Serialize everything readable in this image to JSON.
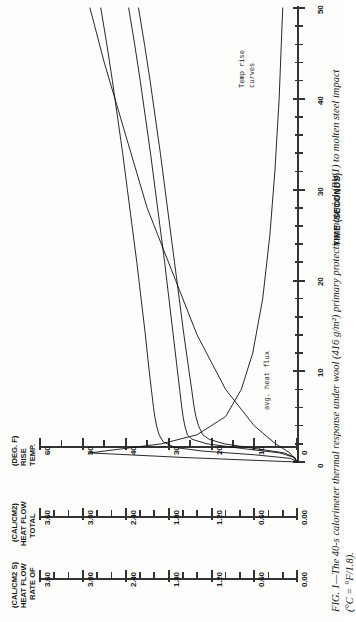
{
  "figure": {
    "caption_line1": "FIG. 1—The 40-s calorimeter thermal response under wool (416 g/m²) primary protection material (PW1) to molten steel impact",
    "caption_line2": "(°C = °F/1.8).",
    "caption_label": "FIG. 1—"
  },
  "annotations": {
    "temp_rise_line1": "Temp rise",
    "temp_rise_line2": "curves",
    "heat_flux": "avg. heat flux"
  },
  "axes": {
    "time": {
      "title": "TIME (SECONDS)",
      "min": 0,
      "max": 50,
      "major_step": 10,
      "minor_step": 2,
      "labels": [
        "0",
        "10",
        "20",
        "30",
        "40",
        "50"
      ],
      "label_values": [
        0,
        10,
        20,
        30,
        40,
        50
      ]
    },
    "temp_rise": {
      "title_lines": [
        "TEMP.",
        "RISE",
        "(DEG. F)"
      ],
      "min": 0,
      "max": 60,
      "major_step": 10,
      "minor_step": 5,
      "labels": [
        "60",
        "50",
        "40",
        "30",
        "20",
        "10",
        "0"
      ],
      "label_values": [
        60,
        50,
        40,
        30,
        20,
        10,
        0
      ]
    },
    "total_heat_flow": {
      "title_lines": [
        "TOTAL",
        "HEAT FLOW",
        "(CAL/CM2)"
      ],
      "title_superscript": "2",
      "min": 0.0,
      "max": 3.6,
      "major_step": 0.6,
      "minor_step": 0.2,
      "labels": [
        "3.60",
        "3.00",
        "2.40",
        "1.80",
        "1.20",
        "0.60",
        "0.00"
      ],
      "label_values": [
        3.6,
        3.0,
        2.4,
        1.8,
        1.2,
        0.6,
        0.0
      ]
    },
    "rate_of_heat_flow": {
      "title_lines": [
        "RATE OF",
        "HEAT FLOW",
        "(CAL/CM2 S)"
      ],
      "title_superscript": "2",
      "min": 0.0,
      "max": 3.6,
      "major_step": 0.6,
      "minor_step": 0.2,
      "labels": [
        "3.60",
        "3.00",
        "2.40",
        "1.80",
        "1.20",
        "0.60",
        "0.00"
      ],
      "label_values": [
        3.6,
        3.0,
        2.4,
        1.8,
        1.2,
        0.6,
        0.0
      ]
    }
  },
  "chart_data": {
    "type": "line",
    "orientation": "rotated-90-ccw",
    "xlabel": "TIME (SECONDS)",
    "ylabel": "TEMP. RISE (DEG. F)",
    "xlim": [
      0,
      50
    ],
    "ylim": [
      0,
      60
    ],
    "grid": false,
    "legend": "in-plot annotations",
    "series": [
      {
        "name": "Temp rise curve 1",
        "annotation": "Temp rise curves",
        "x": [
          0,
          0.5,
          1,
          1.5,
          2,
          2.5,
          3,
          4,
          5,
          6,
          8,
          10,
          14,
          18,
          22,
          26,
          30,
          34,
          38,
          42,
          46,
          50
        ],
        "y": [
          0,
          0.5,
          3,
          10,
          17,
          20.5,
          22,
          23,
          23.6,
          24,
          24.6,
          25.2,
          26.4,
          27.5,
          28.6,
          29.7,
          30.8,
          31.9,
          33.1,
          34.3,
          35.6,
          37.0
        ]
      },
      {
        "name": "Temp rise curve 2",
        "x": [
          0,
          0.5,
          1,
          1.5,
          2,
          2.5,
          3,
          4,
          5,
          6,
          8,
          10,
          14,
          18,
          22,
          26,
          30,
          34,
          38,
          42,
          46,
          50
        ],
        "y": [
          0,
          0.6,
          4,
          13,
          21,
          24.5,
          25.6,
          26.2,
          26.6,
          26.9,
          27.4,
          27.9,
          28.9,
          29.9,
          30.9,
          32.0,
          33.1,
          34.2,
          35.4,
          36.6,
          37.9,
          39.3
        ]
      },
      {
        "name": "Temp rise curve 3",
        "x": [
          0,
          0.4,
          0.8,
          1.2,
          1.6,
          2.2,
          3,
          4,
          5,
          6,
          8,
          10,
          14,
          18,
          22,
          26,
          30,
          34,
          38,
          42,
          46,
          50
        ],
        "y": [
          0,
          1.5,
          10,
          22,
          28.5,
          31.2,
          32.2,
          32.8,
          33.2,
          33.5,
          34.0,
          34.5,
          35.4,
          36.4,
          37.4,
          38.5,
          39.6,
          40.7,
          41.9,
          43.1,
          44.4,
          45.8
        ]
      },
      {
        "name": "avg. heat flux",
        "annotation": "avg. heat flux",
        "axis": "rate_of_heat_flow",
        "x": [
          0,
          0.5,
          1,
          1.5,
          2,
          3,
          5,
          8,
          12,
          18,
          25,
          32,
          40,
          46,
          50
        ],
        "y": [
          0,
          1.6,
          2.9,
          2.4,
          1.9,
          1.4,
          1.0,
          0.78,
          0.62,
          0.48,
          0.38,
          0.31,
          0.25,
          0.22,
          0.2
        ]
      },
      {
        "name": "total heat flow",
        "axis": "total_heat_flow",
        "x": [
          0,
          1,
          2,
          4,
          8,
          14,
          20,
          28,
          36,
          44,
          50
        ],
        "y": [
          0,
          0.1,
          0.3,
          0.6,
          1.0,
          1.4,
          1.7,
          2.1,
          2.4,
          2.7,
          2.9
        ]
      }
    ]
  }
}
